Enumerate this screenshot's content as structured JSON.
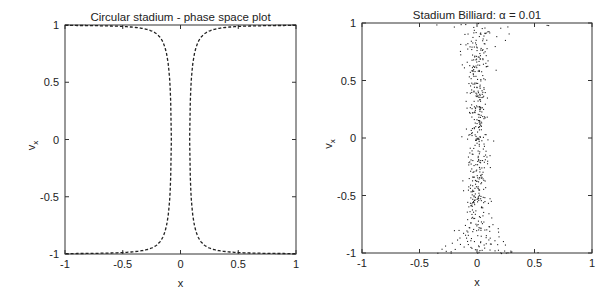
{
  "chart_data": [
    {
      "type": "line",
      "title": "Circular stadium - phase space plot",
      "xlabel": "x",
      "ylabel": "v_x",
      "xlim": [
        -1,
        1
      ],
      "ylim": [
        -1,
        1
      ],
      "xticks": [
        "-1",
        "-0.5",
        "0",
        "0.5",
        "1"
      ],
      "yticks": [
        "1",
        "0.5",
        "0",
        "-0.5",
        "-1"
      ],
      "grid": false,
      "line_style": "dashed",
      "series": [
        {
          "name": "left-branch",
          "description": "v_x ≈ sign(v)*sqrt(1-(0.08/x)^2) mirrored; vertical asymptote near x=-0.08",
          "x": [
            -1,
            -0.8,
            -0.6,
            -0.4,
            -0.3,
            -0.2,
            -0.15,
            -0.12,
            -0.1,
            -0.09,
            -0.085,
            -0.085,
            -0.09,
            -0.1,
            -0.12,
            -0.15,
            -0.2,
            -0.3,
            -0.4,
            -0.6,
            -0.8,
            -1
          ],
          "y": [
            1,
            1,
            0.99,
            0.98,
            0.96,
            0.92,
            0.85,
            0.75,
            0.6,
            0.45,
            0.2,
            -0.2,
            -0.45,
            -0.6,
            -0.75,
            -0.85,
            -0.92,
            -0.96,
            -0.98,
            -0.99,
            -1,
            -1
          ]
        },
        {
          "name": "right-branch",
          "description": "mirror of left branch about x=0; vertical asymptote near x=0.08",
          "x": [
            1,
            0.8,
            0.6,
            0.4,
            0.3,
            0.2,
            0.15,
            0.12,
            0.1,
            0.09,
            0.085,
            0.085,
            0.09,
            0.1,
            0.12,
            0.15,
            0.2,
            0.3,
            0.4,
            0.6,
            0.8,
            1
          ],
          "y": [
            1,
            1,
            0.99,
            0.98,
            0.96,
            0.92,
            0.85,
            0.75,
            0.6,
            0.45,
            0.2,
            -0.2,
            -0.45,
            -0.6,
            -0.75,
            -0.85,
            -0.92,
            -0.96,
            -0.98,
            -0.99,
            -1,
            -1
          ]
        }
      ],
      "curve_params": {
        "asymptote_x": 0.08
      }
    },
    {
      "type": "scatter",
      "title": "Stadium Billiard: α = 0.01",
      "xlabel": "x",
      "ylabel": "v_x",
      "xlim": [
        -1,
        1
      ],
      "ylim": [
        -1,
        1
      ],
      "xticks": [
        "-1",
        "-0.5",
        "0",
        "0.5",
        "1"
      ],
      "yticks": [
        "1",
        "0.5",
        "0",
        "-0.5",
        "-1"
      ],
      "grid": false,
      "description": "~500 scattered points forming an hourglass band centred at x≈0; width ≈ ±0.1 near v_x=0, widening to ±0.3 near v_x=±0.9, with sparse points spreading to x≈±0.65 along v_x=±1",
      "scatter_params": {
        "n_points": 520,
        "seed": 7,
        "core_halfwidth": 0.08,
        "flare_halfwidth": 0.32,
        "edge_spread": 0.65
      }
    }
  ],
  "layout": {
    "panels": [
      {
        "left": 65,
        "top": 25,
        "right": 296,
        "bottom": 254
      },
      {
        "left": 362,
        "top": 23,
        "right": 592,
        "bottom": 253
      }
    ]
  }
}
